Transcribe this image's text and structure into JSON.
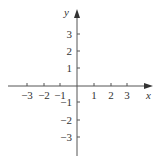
{
  "figure": {
    "type": "coordinate-plane",
    "x_axis": {
      "label": "x",
      "ticks": [
        {
          "value": -3,
          "label": "−3",
          "px": 27
        },
        {
          "value": -2,
          "label": "−2",
          "px": 44
        },
        {
          "value": -1,
          "label": "−1",
          "px": 60
        },
        {
          "value": 1,
          "label": "1",
          "px": 94
        },
        {
          "value": 2,
          "label": "2",
          "px": 111
        },
        {
          "value": 3,
          "label": "3",
          "px": 127
        }
      ]
    },
    "y_axis": {
      "label": "y",
      "ticks": [
        {
          "value": 3,
          "label": "3",
          "px": 34
        },
        {
          "value": 2,
          "label": "2",
          "px": 51
        },
        {
          "value": 1,
          "label": "1",
          "px": 68
        },
        {
          "value": -1,
          "label": "−1",
          "px": 102
        },
        {
          "value": -2,
          "label": "−2",
          "px": 120
        },
        {
          "value": -3,
          "label": "−3",
          "px": 137
        }
      ]
    },
    "colors": {
      "axis": "#555555",
      "text": "#333333",
      "background": "#ffffff"
    }
  }
}
